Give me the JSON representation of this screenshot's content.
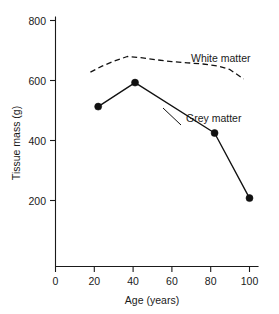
{
  "chart_data": {
    "type": "line",
    "title": "",
    "xlabel": "Age (years)",
    "ylabel": "Tissue mass (g)",
    "xlim": [
      0,
      105
    ],
    "ylim": [
      0,
      800
    ],
    "xticks": [
      0,
      20,
      40,
      60,
      80,
      100
    ],
    "xtick_labels": [
      "0",
      "20",
      "40",
      "60",
      "80",
      "100"
    ],
    "yticks": [
      200,
      400,
      600,
      800
    ],
    "ytick_labels": [
      "200",
      "400",
      "600",
      "800"
    ],
    "grid": false,
    "legend_position": "inline-annotations",
    "series": [
      {
        "name": "White matter",
        "style": "dashed",
        "marker": "none",
        "x": [
          18,
          24,
          30,
          37,
          44,
          52,
          60,
          68,
          76,
          84,
          90,
          97
        ],
        "values": [
          628,
          648,
          664,
          680,
          676,
          669,
          663,
          659,
          655,
          648,
          636,
          605
        ]
      },
      {
        "name": "Grey matter",
        "style": "solid",
        "marker": "filled-circle",
        "x": [
          22,
          41,
          82,
          100
        ],
        "values": [
          513,
          593,
          425,
          208
        ]
      }
    ],
    "annotations": [
      {
        "text": "White matter",
        "x": 86,
        "y": 690
      },
      {
        "text": "Grey matter",
        "x": 73,
        "y": 472
      }
    ]
  },
  "axis": {
    "y_title": "Tissue mass (g)",
    "x_title": "Age (years)",
    "y_tick_labels": [
      "800",
      "600",
      "400",
      "200"
    ],
    "x_tick_labels": [
      "0",
      "20",
      "40",
      "60",
      "80",
      "100"
    ]
  },
  "labels": {
    "white_matter": "White matter",
    "grey_matter": "Grey matter"
  }
}
